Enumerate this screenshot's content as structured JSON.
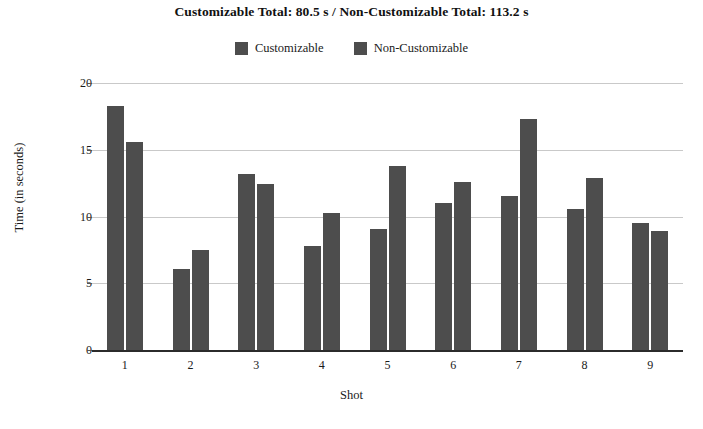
{
  "chart_data": {
    "type": "bar",
    "title": "Customizable Total: 80.5 s / Non-Customizable Total: 113.2 s",
    "xlabel": "Shot",
    "ylabel": "Time (in seconds)",
    "categories": [
      "1",
      "2",
      "3",
      "4",
      "5",
      "6",
      "7",
      "8",
      "9"
    ],
    "series": [
      {
        "name": "Customizable",
        "color": "#4d4d4d",
        "values": [
          18.3,
          6.1,
          13.2,
          7.8,
          9.1,
          11.0,
          11.5,
          10.6,
          9.5
        ]
      },
      {
        "name": "Non-Customizable",
        "color": "#4d4d4d",
        "values": [
          15.6,
          7.5,
          12.4,
          10.3,
          13.8,
          12.6,
          17.3,
          12.9,
          8.9
        ]
      }
    ],
    "ylim": [
      0,
      20
    ],
    "yticks": [
      0,
      5,
      10,
      15,
      20
    ],
    "ytick_labels": [
      "0",
      "5",
      "10",
      "15",
      "20"
    ],
    "grid": true,
    "grid_axis": "y",
    "legend_position": "top-center",
    "totals": {
      "customizable": "80.5 s",
      "non_customizable": "113.2 s"
    }
  },
  "legend": {
    "items": [
      {
        "label": "Customizable"
      },
      {
        "label": "Non-Customizable"
      }
    ]
  },
  "colors": {
    "bar": "#4d4d4d",
    "grid": "#c9c9c9",
    "axis": "#2b2b2b",
    "background": "#ffffff",
    "text": "#1a1a1a"
  }
}
